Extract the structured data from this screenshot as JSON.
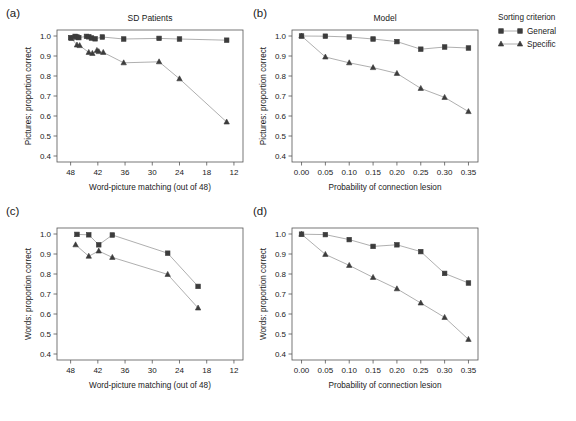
{
  "figure": {
    "background": "#ffffff",
    "marker_color": "#3c3c3c",
    "line_color": "#9a9a9a",
    "axis_color": "#555555"
  },
  "legend": {
    "title": "Sorting criterion",
    "entries": [
      {
        "label": "General",
        "marker": "square"
      },
      {
        "label": "Specific",
        "marker": "triangle"
      }
    ]
  },
  "panels": [
    {
      "letter": "(a)",
      "title": "SD Patients"
    },
    {
      "letter": "(b)",
      "title": "Model"
    },
    {
      "letter": "(c)",
      "title": ""
    },
    {
      "letter": "(d)",
      "title": ""
    }
  ],
  "chart_data": [
    {
      "panel": "(a)",
      "type": "scatter",
      "title": "SD Patients",
      "xlabel": "Word-picture matching (out of 48)",
      "ylabel": "Pictures: proportion correct",
      "xlim": [
        51,
        10
      ],
      "ylim": [
        0.37,
        1.03
      ],
      "x_reversed": true,
      "xticks": [
        48,
        42,
        36,
        30,
        24,
        18,
        12
      ],
      "yticks": [
        0.4,
        0.5,
        0.6,
        0.7,
        0.8,
        0.9,
        1.0
      ],
      "grid": false,
      "series": [
        {
          "name": "General",
          "marker": "square",
          "x": [
            48.0,
            47.0,
            46.6,
            46.2,
            44.5,
            44.0,
            43.4,
            42.6,
            41.0,
            36.3,
            28.5,
            24.0,
            13.6
          ],
          "y": [
            0.992,
            0.998,
            0.995,
            0.992,
            0.998,
            0.996,
            0.99,
            0.986,
            0.995,
            0.985,
            0.988,
            0.985,
            0.979
          ]
        },
        {
          "name": "Specific",
          "marker": "triangle",
          "x": [
            47.8,
            46.6,
            46.0,
            44.0,
            43.2,
            42.2,
            41.8,
            40.8,
            36.3,
            28.5,
            24.0,
            13.6
          ],
          "y": [
            0.988,
            0.955,
            0.952,
            0.918,
            0.913,
            0.928,
            0.922,
            0.918,
            0.866,
            0.871,
            0.786,
            0.57
          ]
        }
      ]
    },
    {
      "panel": "(b)",
      "type": "line",
      "title": "Model",
      "xlabel": "Probability of connection lesion",
      "ylabel": "Pictures: proportion correct",
      "xlim": [
        -0.02,
        0.37
      ],
      "ylim": [
        0.37,
        1.03
      ],
      "x_reversed": false,
      "xticks": [
        0.0,
        0.05,
        0.1,
        0.15,
        0.2,
        0.25,
        0.3,
        0.35
      ],
      "xtick_labels": [
        "0.00",
        "0.05",
        "0.10",
        "0.15",
        "0.20",
        "0.25",
        "0.30",
        "0.35"
      ],
      "yticks": [
        0.4,
        0.5,
        0.6,
        0.7,
        0.8,
        0.9,
        1.0
      ],
      "grid": false,
      "series": [
        {
          "name": "General",
          "marker": "square",
          "x": [
            0.0,
            0.05,
            0.1,
            0.15,
            0.2,
            0.25,
            0.3,
            0.35
          ],
          "y": [
            1.0,
            0.999,
            0.995,
            0.985,
            0.972,
            0.934,
            0.945,
            0.94
          ]
        },
        {
          "name": "Specific",
          "marker": "triangle",
          "x": [
            0.0,
            0.05,
            0.1,
            0.15,
            0.2,
            0.25,
            0.3,
            0.35
          ],
          "y": [
            1.0,
            0.895,
            0.866,
            0.842,
            0.813,
            0.738,
            0.693,
            0.622
          ]
        }
      ]
    },
    {
      "panel": "(c)",
      "type": "scatter",
      "title": "",
      "xlabel": "Word-picture matching (out of 48)",
      "ylabel": "Words: proportion correct",
      "xlim": [
        51,
        10
      ],
      "ylim": [
        0.37,
        1.03
      ],
      "x_reversed": true,
      "xticks": [
        48,
        42,
        36,
        30,
        24,
        18,
        12
      ],
      "yticks": [
        0.4,
        0.5,
        0.6,
        0.7,
        0.8,
        0.9,
        1.0
      ],
      "grid": false,
      "series": [
        {
          "name": "General",
          "marker": "square",
          "x": [
            46.6,
            44.0,
            41.8,
            38.8,
            26.6,
            19.9
          ],
          "y": [
            0.998,
            0.996,
            0.946,
            0.995,
            0.904,
            0.738
          ]
        },
        {
          "name": "Specific",
          "marker": "triangle",
          "x": [
            46.9,
            44.0,
            41.8,
            38.8,
            26.6,
            19.9
          ],
          "y": [
            0.946,
            0.889,
            0.915,
            0.883,
            0.798,
            0.63
          ]
        }
      ]
    },
    {
      "panel": "(d)",
      "type": "line",
      "title": "",
      "xlabel": "Probability of connection lesion",
      "ylabel": "Words: proportion correct",
      "xlim": [
        -0.02,
        0.37
      ],
      "ylim": [
        0.37,
        1.03
      ],
      "x_reversed": false,
      "xticks": [
        0.0,
        0.05,
        0.1,
        0.15,
        0.2,
        0.25,
        0.3,
        0.35
      ],
      "xtick_labels": [
        "0.00",
        "0.05",
        "0.10",
        "0.15",
        "0.20",
        "0.25",
        "0.30",
        "0.35"
      ],
      "yticks": [
        0.4,
        0.5,
        0.6,
        0.7,
        0.8,
        0.9,
        1.0
      ],
      "grid": false,
      "series": [
        {
          "name": "General",
          "marker": "square",
          "x": [
            0.0,
            0.05,
            0.1,
            0.15,
            0.2,
            0.25,
            0.3,
            0.35
          ],
          "y": [
            0.999,
            0.997,
            0.972,
            0.938,
            0.946,
            0.912,
            0.803,
            0.755
          ]
        },
        {
          "name": "Specific",
          "marker": "triangle",
          "x": [
            0.0,
            0.05,
            0.1,
            0.15,
            0.2,
            0.25,
            0.3,
            0.35
          ],
          "y": [
            0.999,
            0.898,
            0.843,
            0.783,
            0.726,
            0.655,
            0.583,
            0.473
          ]
        }
      ]
    }
  ]
}
